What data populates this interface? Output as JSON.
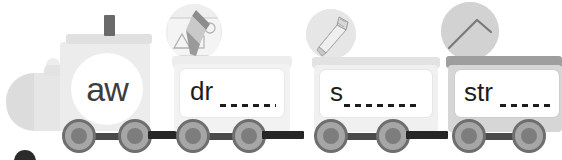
{
  "worksheet": {
    "title": "Phonics Blend Train",
    "type": "train-illustration"
  },
  "engine": {
    "label": "aw",
    "chimney_icon": "chimney-icon",
    "dome_icon": "steam-dome-icon"
  },
  "cars": [
    {
      "id": "car-dr",
      "prefix": "dr",
      "blank": "________",
      "picture_icon": "drawing-picture-icon",
      "picture_label": "drawing",
      "top_bar_color": "#ededed"
    },
    {
      "id": "car-s",
      "prefix": "s",
      "blank": "__________",
      "picture_icon": "saw-picture-icon",
      "picture_label": "saw",
      "top_bar_color": "#e2e2e2"
    },
    {
      "id": "car-str",
      "prefix": "str",
      "blank": "_______",
      "picture_icon": "straw-picture-icon",
      "picture_label": "straw",
      "top_bar_color": "#9e9e9e"
    }
  ],
  "colors": {
    "wheel_fill": "#a6a6a6",
    "wheel_rim": "#6e6e6e",
    "axle": "#4a4a4a",
    "coupler": "#262626",
    "card": "#ffffff",
    "text": "#1c1c1c",
    "engine_body": "#ececec"
  }
}
